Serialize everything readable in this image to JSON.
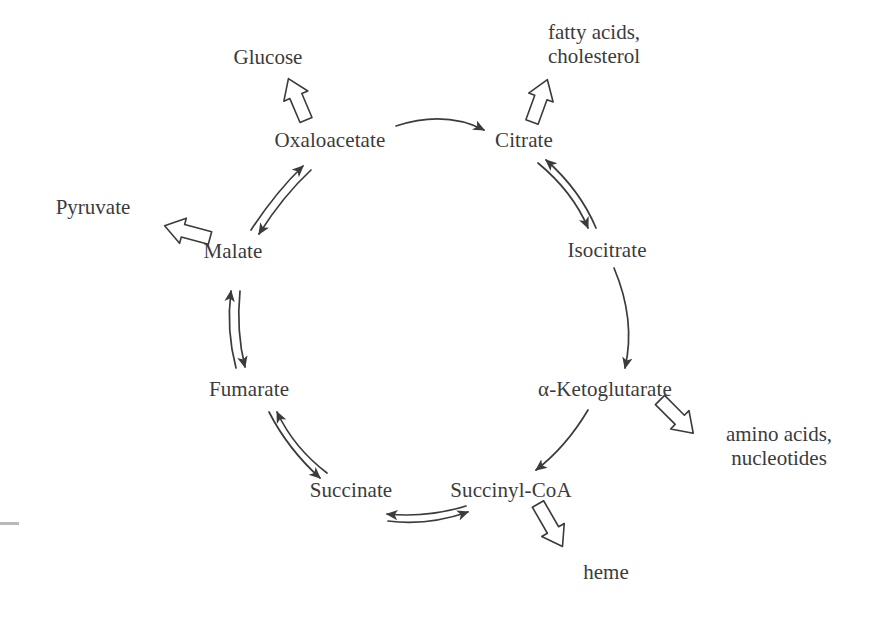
{
  "diagram": {
    "type": "cycle-diagram",
    "text_color": "#3b3b3b",
    "stroke_color": "#3b3b3b",
    "background": "#ffffff",
    "cycle_nodes": [
      {
        "id": "oxaloacetate",
        "label": "Oxaloacetate",
        "x": 330,
        "y": 140
      },
      {
        "id": "citrate",
        "label": "Citrate",
        "x": 524,
        "y": 140
      },
      {
        "id": "isocitrate",
        "label": "Isocitrate",
        "x": 607,
        "y": 250
      },
      {
        "id": "ketoglutarate",
        "label": "α-Ketoglutarate",
        "x": 605,
        "y": 389
      },
      {
        "id": "succinyl-coa",
        "label": "Succinyl-CoA",
        "x": 511,
        "y": 490
      },
      {
        "id": "succinate",
        "label": "Succinate",
        "x": 351,
        "y": 490
      },
      {
        "id": "fumarate",
        "label": "Fumarate",
        "x": 249,
        "y": 389
      },
      {
        "id": "malate",
        "label": "Malate",
        "x": 233,
        "y": 251
      }
    ],
    "product_nodes": [
      {
        "id": "glucose",
        "label": "Glucose",
        "x": 268,
        "y": 58
      },
      {
        "id": "fatty-acids",
        "label": "fatty acids,\ncholesterol",
        "x": 594,
        "y": 45
      },
      {
        "id": "pyruvate",
        "label": "Pyruvate",
        "x": 93,
        "y": 208
      },
      {
        "id": "amino-acids",
        "label": "amino acids,\nnucleotides",
        "x": 779,
        "y": 447
      },
      {
        "id": "heme",
        "label": "heme",
        "x": 606,
        "y": 573
      }
    ],
    "cycle_reactions": [
      {
        "id": "oxaloacetate-to-citrate",
        "from": "Oxaloacetate",
        "to": "Citrate",
        "arrow": "single"
      },
      {
        "id": "citrate-to-isocitrate",
        "from": "Citrate",
        "to": "Isocitrate",
        "arrow": "reversible"
      },
      {
        "id": "isocitrate-to-ketoglutarate",
        "from": "Isocitrate",
        "to": "α-Ketoglutarate",
        "arrow": "single"
      },
      {
        "id": "ketoglutarate-to-succinylcoa",
        "from": "α-Ketoglutarate",
        "to": "Succinyl-CoA",
        "arrow": "single"
      },
      {
        "id": "succinylcoa-to-succinate",
        "from": "Succinyl-CoA",
        "to": "Succinate",
        "arrow": "reversible"
      },
      {
        "id": "succinate-to-fumarate",
        "from": "Succinate",
        "to": "Fumarate",
        "arrow": "reversible"
      },
      {
        "id": "fumarate-to-malate",
        "from": "Fumarate",
        "to": "Malate",
        "arrow": "reversible"
      },
      {
        "id": "malate-to-oxaloacetate",
        "from": "Malate",
        "to": "Oxaloacetate",
        "arrow": "reversible"
      }
    ],
    "product_reactions": [
      {
        "id": "oxaloacetate-to-glucose",
        "from": "Oxaloacetate",
        "to": "Glucose",
        "arrow": "block"
      },
      {
        "id": "citrate-to-fatty-acids",
        "from": "Citrate",
        "to": "fatty acids, cholesterol",
        "arrow": "block"
      },
      {
        "id": "malate-to-pyruvate",
        "from": "Malate",
        "to": "Pyruvate",
        "arrow": "block"
      },
      {
        "id": "ketoglutarate-to-amino-acids",
        "from": "α-Ketoglutarate",
        "to": "amino acids, nucleotides",
        "arrow": "block"
      },
      {
        "id": "succinylcoa-to-heme",
        "from": "Succinyl-CoA",
        "to": "heme",
        "arrow": "block"
      }
    ]
  }
}
